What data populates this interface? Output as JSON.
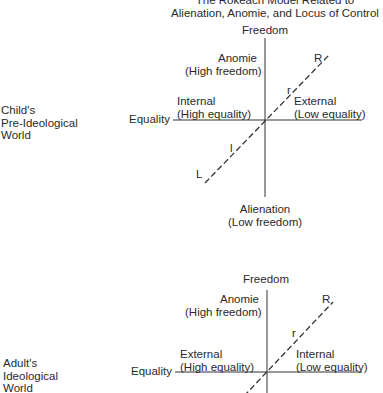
{
  "title": {
    "line1": "The Rokeach Model Related to",
    "line2": "Alienation, Anomie, and Locus of Control"
  },
  "diagrams": [
    {
      "world_label": "Child's\nPre-Ideological\nWorld",
      "top_axis": "Freedom",
      "left_axis": "Equality",
      "upper_left_line1": "Anomie",
      "upper_left_line2": "(High freedom)",
      "mid_left_line1": "Internal",
      "mid_left_line2": "(High equality)",
      "mid_right_line1": "External",
      "mid_right_line2": "(Low equality)",
      "bottom_line1": "Alienation",
      "bottom_line2": "(Low freedom)",
      "markers": {
        "R": "R",
        "r": "r",
        "l": "l",
        "L": "L"
      }
    },
    {
      "world_label": "Adult's\nIdeological\nWorld",
      "top_axis": "Freedom",
      "left_axis": "Equality",
      "upper_left_line1": "Anomie",
      "upper_left_line2": "(High freedom)",
      "mid_left_line1": "External",
      "mid_left_line2": "(High equality)",
      "mid_right_line1": "Internal",
      "mid_right_line2": "(Low equality)",
      "markers": {
        "R": "R",
        "r": "r"
      }
    }
  ]
}
